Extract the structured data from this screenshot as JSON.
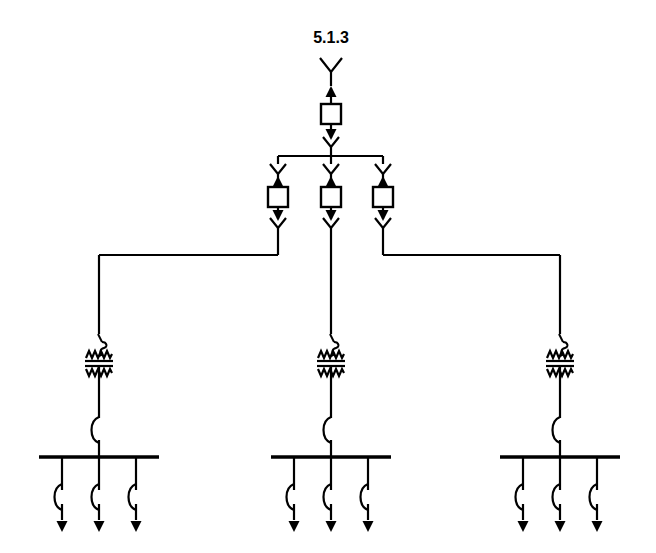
{
  "diagram": {
    "title": "5.1.3",
    "title_x": 331,
    "title_y": 43,
    "type": "single-line-diagram",
    "colors": {
      "line": "#000000",
      "background": "#ffffff",
      "fill": "#ffffff"
    },
    "canvas": {
      "width": 656,
      "height": 553
    },
    "source": {
      "name": "wye-source-symbol",
      "x": 331,
      "y_top": 58,
      "y_bottom": 86
    },
    "main_breaker": {
      "name": "main-breaker-unit",
      "x": 331,
      "box_cx": 331,
      "box_cy": 114,
      "box_w": 20,
      "box_h": 20,
      "arrow_up_y1": 104,
      "arrow_up_y0": 86,
      "arrow_down_y0": 124,
      "arrow_down_y1": 140,
      "chevron_y": 145
    },
    "upper_bus": {
      "name": "upper-distribution-bus",
      "y": 156,
      "x_left": 278,
      "x_right": 383,
      "feed_x": 331,
      "feed_y_top": 145
    },
    "branch_units": [
      {
        "name": "branch-unit-left",
        "x": 278,
        "route": "left"
      },
      {
        "name": "branch-unit-center",
        "x": 331,
        "route": "straight"
      },
      {
        "name": "branch-unit-right",
        "x": 383,
        "route": "right"
      }
    ],
    "branch_geometry": {
      "chevron_top_y": 166,
      "arrow_up_y0": 172,
      "arrow_up_y1": 186,
      "box_cy": 197,
      "box_w": 20,
      "box_h": 20,
      "arrow_down_y0": 207,
      "arrow_down_y1": 220,
      "chevron_bottom_y": 226,
      "exit_y": 240
    },
    "routing": {
      "name": "branch-routing-bus",
      "y": 255,
      "left_target_x": 99,
      "center_x": 331,
      "right_target_x": 560,
      "drop_to_y": 330
    },
    "feeder_groups": [
      {
        "name": "feeder-group-left",
        "center_x": 99,
        "bus_x_left": 39,
        "bus_x_right": 159,
        "bus_y": 457,
        "transformer_y": 358,
        "breaker_y": 430,
        "taps": [
          {
            "name": "feeder-left-1",
            "x": 62
          },
          {
            "name": "feeder-left-2",
            "x": 99
          },
          {
            "name": "feeder-left-3",
            "x": 136
          }
        ]
      },
      {
        "name": "feeder-group-center",
        "center_x": 331,
        "bus_x_left": 271,
        "bus_x_right": 391,
        "bus_y": 457,
        "transformer_y": 358,
        "breaker_y": 430,
        "taps": [
          {
            "name": "feeder-center-1",
            "x": 294
          },
          {
            "name": "feeder-center-2",
            "x": 331
          },
          {
            "name": "feeder-center-3",
            "x": 368
          }
        ]
      },
      {
        "name": "feeder-group-right",
        "center_x": 560,
        "bus_x_left": 500,
        "bus_x_right": 620,
        "bus_y": 457,
        "transformer_y": 358,
        "breaker_y": 430,
        "taps": [
          {
            "name": "feeder-right-1",
            "x": 523
          },
          {
            "name": "feeder-right-2",
            "x": 560
          },
          {
            "name": "feeder-right-3",
            "x": 597
          }
        ]
      }
    ],
    "feeder_geometry": {
      "tap_y_top": 457,
      "tap_y_breaker": 497,
      "arrow_y_end": 532
    },
    "symbol_names": {
      "source": "wye-source-icon",
      "box": "breaker-box-icon",
      "arrow_up": "arrow-up-icon",
      "arrow_down": "arrow-down-icon",
      "chevron_down": "chevron-down-icon",
      "transformer": "transformer-icon",
      "breaker_arc": "breaker-arc-icon",
      "feeder_arrow": "feeder-arrow-icon",
      "busbar": "busbar"
    }
  }
}
